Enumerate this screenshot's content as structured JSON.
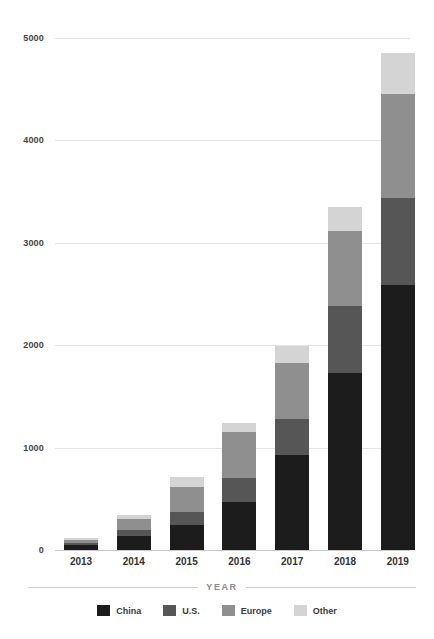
{
  "chart_data": {
    "type": "bar",
    "stacked": true,
    "title": "",
    "xlabel": "YEAR",
    "ylabel": "",
    "categories": [
      "2013",
      "2014",
      "2015",
      "2016",
      "2017",
      "2018",
      "2019"
    ],
    "series": [
      {
        "name": "China",
        "color": "#1c1c1c",
        "values": [
          50,
          140,
          240,
          470,
          930,
          1730,
          2590
        ]
      },
      {
        "name": "U.S.",
        "color": "#565656",
        "values": [
          20,
          60,
          130,
          230,
          350,
          650,
          850
        ]
      },
      {
        "name": "Europe",
        "color": "#8f8f8f",
        "values": [
          30,
          100,
          250,
          450,
          550,
          740,
          1010
        ]
      },
      {
        "name": "Other",
        "color": "#d4d4d4",
        "values": [
          20,
          40,
          90,
          90,
          160,
          230,
          400
        ]
      }
    ],
    "totals": [
      120,
      340,
      710,
      1240,
      1990,
      3350,
      4850
    ],
    "ylim": [
      0,
      5000
    ],
    "yticks": [
      0,
      1000,
      2000,
      3000,
      4000,
      5000
    ],
    "ytick_labels": [
      "0",
      "1000",
      "2000",
      "3000",
      "4000",
      "5000"
    ],
    "grid": true,
    "legend_position": "bottom"
  },
  "axis": {
    "x_title": "YEAR"
  },
  "legend": {
    "items": [
      {
        "label": "China",
        "color": "#1c1c1c"
      },
      {
        "label": "U.S.",
        "color": "#565656"
      },
      {
        "label": "Europe",
        "color": "#8f8f8f"
      },
      {
        "label": "Other",
        "color": "#d4d4d4"
      }
    ]
  },
  "colors": {
    "background": "#ffffff",
    "gridline": "#e4e4e4",
    "axis_text": "#3a3a3a",
    "axis_title": "#8c8c8c"
  }
}
